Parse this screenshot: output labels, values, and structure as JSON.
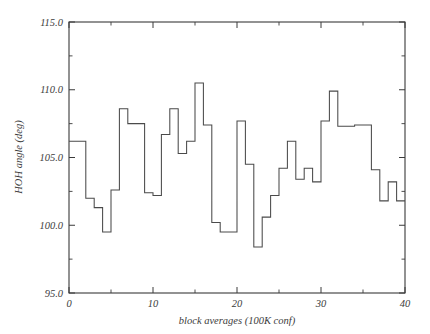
{
  "chart_data": {
    "type": "line",
    "subtype": "step-post",
    "title": "",
    "xlabel": "block averages (100K conf)",
    "ylabel": "HOH angle (deg)",
    "xlim": [
      0,
      40
    ],
    "ylim": [
      95.0,
      115.0
    ],
    "xticks": [
      0,
      10,
      20,
      30,
      40
    ],
    "xtick_labels": [
      "0",
      "10",
      "20",
      "30",
      "40"
    ],
    "xticks_minor": [
      5,
      15,
      25,
      35
    ],
    "yticks": [
      95.0,
      100.0,
      105.0,
      110.0,
      115.0
    ],
    "ytick_labels": [
      "95.0",
      "100.0",
      "105.0",
      "110.0",
      "115.0"
    ],
    "yticks_minor": [
      97.5,
      102.5,
      107.5,
      112.5
    ],
    "grid": false,
    "legend": null,
    "line_color": "#4a4a4a",
    "x": [
      0,
      1,
      2,
      3,
      4,
      5,
      6,
      7,
      8,
      9,
      10,
      11,
      12,
      13,
      14,
      15,
      16,
      17,
      18,
      19,
      20,
      21,
      22,
      23,
      24,
      25,
      26,
      27,
      28,
      29,
      30,
      31,
      32,
      33,
      34,
      35,
      36,
      37,
      38,
      39
    ],
    "values": [
      106.2,
      106.2,
      102.0,
      101.3,
      99.5,
      102.6,
      108.6,
      107.5,
      107.5,
      102.4,
      102.2,
      106.7,
      108.6,
      105.3,
      106.2,
      110.5,
      107.4,
      100.2,
      99.5,
      99.5,
      107.7,
      104.5,
      98.4,
      100.6,
      102.2,
      104.2,
      106.2,
      103.4,
      104.2,
      103.2,
      107.7,
      109.9,
      107.3,
      107.3,
      107.4,
      107.4,
      104.1,
      101.8,
      103.2,
      101.8
    ],
    "series_name": "HOH angle"
  },
  "axis": {
    "x_title": "block averages (100K conf)",
    "y_title": "HOH angle (deg)"
  }
}
